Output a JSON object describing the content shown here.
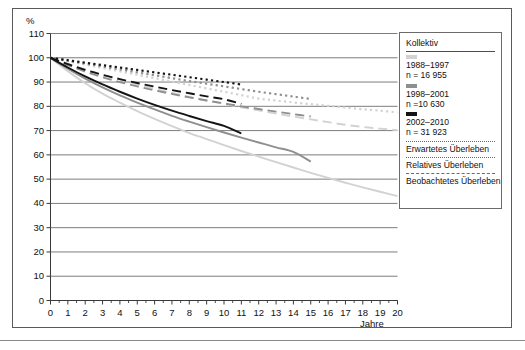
{
  "axes": {
    "y_title": "%",
    "x_title": "Jahre",
    "y_ticks": [
      0,
      10,
      20,
      30,
      40,
      50,
      60,
      70,
      80,
      90,
      100,
      110
    ],
    "x_ticks": [
      0,
      1,
      2,
      3,
      4,
      5,
      6,
      7,
      8,
      9,
      10,
      11,
      12,
      13,
      14,
      15,
      16,
      17,
      18,
      19,
      20
    ]
  },
  "legend": {
    "title": "Kollektiv",
    "cohorts": [
      {
        "swatch_color": "#d2d2d2",
        "period": "1988–1997",
        "n": "n = 16 955"
      },
      {
        "swatch_color": "#8f8f8f",
        "period": "1998–2001",
        "n": "n =10 630"
      },
      {
        "swatch_color": "#141414",
        "period": "2002–2010",
        "n": "n = 31 923"
      }
    ],
    "survival_types": [
      "Erwartetes Überleben",
      "Relatives Überleben",
      "Beobachtetes Überleben"
    ]
  },
  "chart_data": {
    "type": "line",
    "title": "",
    "xlabel": "Jahre",
    "ylabel": "%",
    "xlim": [
      0,
      20
    ],
    "ylim": [
      0,
      110
    ],
    "grid": "horizontal",
    "legend_position": "right",
    "colors": {
      "cohort_1988_1997": "#d2d2d2",
      "cohort_1998_2001": "#8f8f8f",
      "cohort_2002_2010": "#141414"
    },
    "line_styles": {
      "Erwartetes Überleben": "dotted",
      "Relatives Überleben": "dashed",
      "Beobachtetes Überleben": "solid"
    },
    "series": [
      {
        "name": "1988–1997 Erwartetes Überleben",
        "cohort": "1988–1997",
        "survival_type": "Erwartetes Überleben",
        "style": "dotted",
        "color": "#d2d2d2",
        "x": [
          0,
          1,
          2,
          3,
          4,
          5,
          6,
          7,
          8,
          9,
          10,
          11,
          12,
          13,
          14,
          15,
          16,
          17,
          18,
          19,
          20
        ],
        "y": [
          100,
          98.6,
          97.2,
          95.8,
          94.4,
          93.0,
          91.6,
          90.2,
          88.8,
          87.4,
          86.0,
          84.6,
          83.2,
          82.4,
          81.6,
          80.9,
          80.2,
          79.5,
          78.8,
          78.2,
          77.5
        ]
      },
      {
        "name": "1988–1997 Relatives Überleben",
        "cohort": "1988–1997",
        "survival_type": "Relatives Überleben",
        "style": "dashed",
        "color": "#d2d2d2",
        "x": [
          0,
          1,
          2,
          3,
          4,
          5,
          6,
          7,
          8,
          9,
          10,
          11,
          12,
          13,
          14,
          15,
          16,
          17,
          18,
          19,
          20
        ],
        "y": [
          100,
          97.5,
          95.2,
          93.0,
          91.0,
          89.0,
          87.2,
          85.5,
          83.9,
          82.4,
          81.0,
          79.6,
          78.3,
          77.0,
          75.8,
          74.6,
          73.5,
          72.4,
          71.5,
          70.8,
          70.2
        ]
      },
      {
        "name": "1988–1997 Beobachtetes Überleben",
        "cohort": "1988–1997",
        "survival_type": "Beobachtetes Überleben",
        "style": "solid",
        "color": "#d2d2d2",
        "x": [
          0,
          1,
          2,
          3,
          4,
          5,
          6,
          7,
          8,
          9,
          10,
          11,
          12,
          13,
          14,
          15,
          16,
          17,
          18,
          19,
          20
        ],
        "y": [
          100,
          94.5,
          89.5,
          85.2,
          81.5,
          78.0,
          74.8,
          71.8,
          69.0,
          66.5,
          64.0,
          61.6,
          59.3,
          57.0,
          54.8,
          52.6,
          50.5,
          48.5,
          46.6,
          44.8,
          43.0
        ]
      },
      {
        "name": "1998–2001 Erwartetes Überleben",
        "cohort": "1998–2001",
        "survival_type": "Erwartetes Überleben",
        "style": "dotted",
        "color": "#8f8f8f",
        "x": [
          0,
          1,
          2,
          3,
          4,
          5,
          6,
          7,
          8,
          9,
          10,
          11,
          12,
          13,
          14,
          15
        ],
        "y": [
          100,
          98.8,
          97.6,
          96.4,
          95.2,
          94.0,
          92.8,
          91.6,
          90.4,
          89.3,
          88.2,
          87.1,
          86.0,
          85.0,
          84.0,
          83.0
        ]
      },
      {
        "name": "1998–2001 Relatives Überleben",
        "cohort": "1998–2001",
        "survival_type": "Relatives Überleben",
        "style": "dashed",
        "color": "#8f8f8f",
        "x": [
          0,
          1,
          2,
          3,
          4,
          5,
          6,
          7,
          8,
          9,
          10,
          11,
          12,
          13,
          14,
          15
        ],
        "y": [
          100,
          97.0,
          94.3,
          92.0,
          90.0,
          88.2,
          86.6,
          85.1,
          83.7,
          82.4,
          81.2,
          80.0,
          78.9,
          77.8,
          76.8,
          75.8
        ]
      },
      {
        "name": "1998–2001 Beobachtetes Überleben",
        "cohort": "1998–2001",
        "survival_type": "Beobachtetes Überleben",
        "style": "solid",
        "color": "#8f8f8f",
        "x": [
          0,
          1,
          2,
          3,
          4,
          5,
          6,
          7,
          8,
          9,
          10,
          11,
          12,
          13,
          14,
          15
        ],
        "y": [
          100,
          95.5,
          91.4,
          87.8,
          84.5,
          81.5,
          78.7,
          76.1,
          73.7,
          71.4,
          69.2,
          67.1,
          65.1,
          63.1,
          61.2,
          57.2
        ]
      },
      {
        "name": "2002–2010 Erwartetes Überleben",
        "cohort": "2002–2010",
        "survival_type": "Erwartetes Überleben",
        "style": "dotted",
        "color": "#141414",
        "x": [
          0,
          1,
          2,
          3,
          4,
          5,
          6,
          7,
          8,
          9,
          10,
          11
        ],
        "y": [
          100,
          99.0,
          98.0,
          97.0,
          96.0,
          95.0,
          94.0,
          93.0,
          92.0,
          91.0,
          90.0,
          89.0
        ]
      },
      {
        "name": "2002–2010 Relatives Überleben",
        "cohort": "2002–2010",
        "survival_type": "Relatives Überleben",
        "style": "dashed",
        "color": "#141414",
        "x": [
          0,
          1,
          2,
          3,
          4,
          5,
          6,
          7,
          8,
          9,
          10,
          11
        ],
        "y": [
          100,
          97.4,
          95.0,
          93.0,
          91.2,
          89.6,
          88.1,
          86.7,
          85.4,
          84.1,
          82.9,
          81.0
        ]
      },
      {
        "name": "2002–2010 Beobachtetes Überleben",
        "cohort": "2002–2010",
        "survival_type": "Beobachtetes Überleben",
        "style": "solid",
        "color": "#141414",
        "x": [
          0,
          1,
          2,
          3,
          4,
          5,
          6,
          7,
          8,
          9,
          10,
          11
        ],
        "y": [
          100,
          96.0,
          92.3,
          89.0,
          86.0,
          83.2,
          80.6,
          78.2,
          76.0,
          73.9,
          71.9,
          68.8
        ]
      }
    ]
  }
}
